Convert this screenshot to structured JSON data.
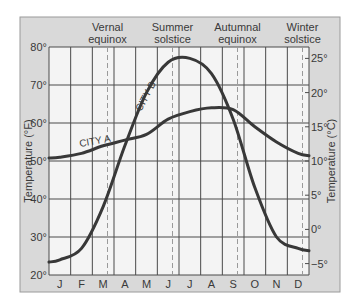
{
  "chart_data": {
    "type": "line",
    "title": "",
    "xlabel": "",
    "ylabel": "Temperature (°F)",
    "ylabel_right": "Temperature (°C)",
    "ylim": [
      20,
      80
    ],
    "categories": [
      "J",
      "F",
      "M",
      "A",
      "M",
      "J",
      "J",
      "A",
      "S",
      "O",
      "N",
      "D"
    ],
    "y_ticks_left": [
      "20°",
      "30°",
      "40°",
      "50°",
      "60°",
      "70°",
      "80°"
    ],
    "y_ticks_right": [
      "−5°",
      "0°",
      "5°",
      "10°",
      "15°",
      "20°",
      "25°"
    ],
    "grid": true,
    "legend": "inline labels on curves",
    "annotations": [
      {
        "label_line1": "Vernal",
        "label_line2": "equinox",
        "month_index": 2
      },
      {
        "label_line1": "Summer",
        "label_line2": "solstice",
        "month_index": 5
      },
      {
        "label_line1": "Autumnal",
        "label_line2": "equinox",
        "month_index": 8
      },
      {
        "label_line1": "Winter",
        "label_line2": "solstice",
        "month_index": 11
      }
    ],
    "series": [
      {
        "name": "CITY A",
        "values": [
          51,
          52,
          54,
          55.5,
          57,
          61,
          63,
          64,
          63.5,
          59,
          55,
          52
        ]
      },
      {
        "name": "CITY B",
        "values": [
          24,
          27,
          38,
          54,
          68,
          76,
          77,
          73,
          61,
          43,
          30,
          27
        ]
      }
    ]
  },
  "colors": {
    "panel_bg": "#d9d9d9",
    "plot_bg": "#f4f4f4",
    "grid": "#4a4a4a",
    "dashed": "#9a9a9a",
    "curve": "#383838",
    "text": "#3a3a3a"
  }
}
